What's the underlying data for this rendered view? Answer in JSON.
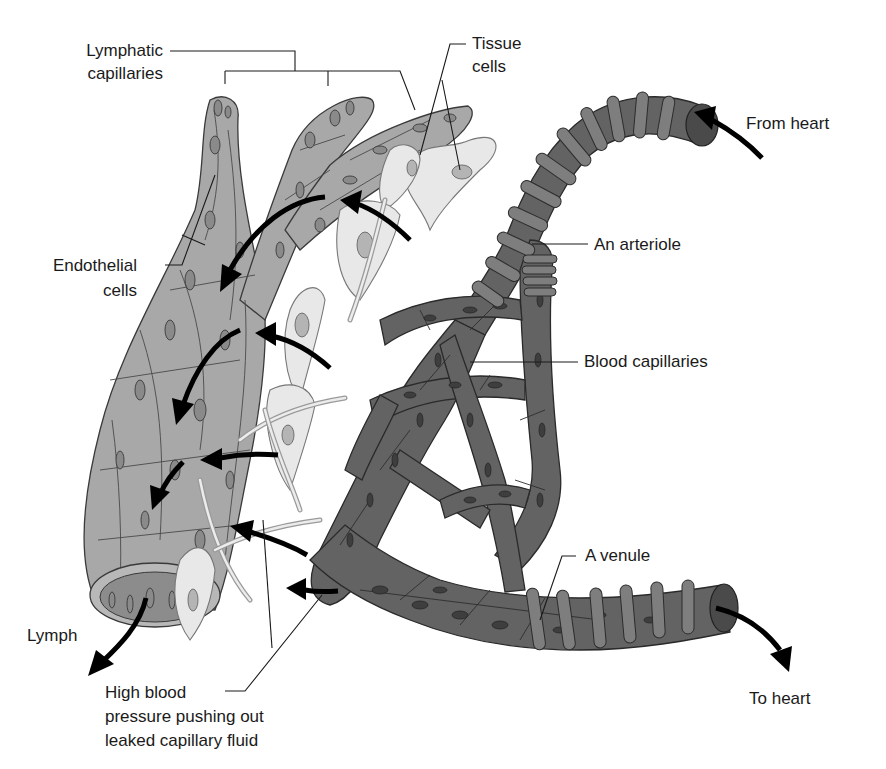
{
  "figure": {
    "labels": {
      "lymphatic_capillaries": [
        "Lymphatic",
        "capillaries"
      ],
      "tissue_cells": [
        "Tissue",
        "cells"
      ],
      "endothelial_cells": [
        "Endothelial",
        "cells"
      ],
      "from_heart": "From heart",
      "an_arteriole": "An arteriole",
      "blood_capillaries": "Blood capillaries",
      "a_venule": "A venule",
      "lymph": "Lymph",
      "to_heart": "To heart",
      "high_blood_pressure": [
        "High blood",
        "pressure pushing out",
        "leaked capillary fluid"
      ]
    },
    "colors": {
      "lymphatic_vessel": "#a8a8a8",
      "blood_vessel": "#636363",
      "smooth_muscle_ring": "#7e7e7e",
      "tissue_cell": "#e8e8e8",
      "arrow": "#000000",
      "background": "#ffffff"
    }
  }
}
